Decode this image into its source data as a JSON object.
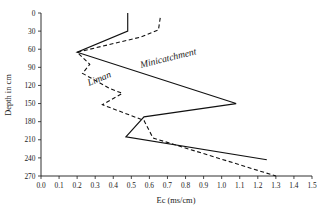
{
  "chart_data": {
    "type": "line",
    "title": "",
    "xlabel": "Ec (ms/cm)",
    "ylabel": "Depth in cm",
    "xlim": [
      0.0,
      1.5
    ],
    "ylim": [
      0,
      270
    ],
    "y_inverted": true,
    "grid": false,
    "legend_position": "inline-annotations",
    "xticks": [
      "0.0",
      "0.1",
      "0.2",
      "0.3",
      "0.4",
      "0.5",
      "0.6",
      "0.7",
      "0.8",
      "0.9",
      "1.0",
      "1.1",
      "1.2",
      "1.3",
      "1.4",
      "1.5"
    ],
    "xtick_values": [
      0.0,
      0.1,
      0.2,
      0.3,
      0.4,
      0.5,
      0.6,
      0.7,
      0.8,
      0.9,
      1.0,
      1.1,
      1.2,
      1.3,
      1.4,
      1.5
    ],
    "yticks": [
      "0",
      "30",
      "60",
      "90",
      "120",
      "150",
      "180",
      "210",
      "240",
      "270"
    ],
    "ytick_values": [
      0,
      30,
      60,
      90,
      120,
      150,
      180,
      210,
      240,
      270
    ],
    "series": [
      {
        "name": "Minicatchment",
        "style": "solid",
        "label_rotation_deg": -14,
        "ec": [
          0.48,
          0.48,
          0.2,
          1.08,
          0.57,
          0.47,
          1.25
        ],
        "depth": [
          0,
          30,
          65,
          150,
          172,
          205,
          243
        ]
      },
      {
        "name": "Liman",
        "style": "dashed",
        "label_rotation_deg": -22,
        "ec": [
          0.66,
          0.65,
          0.55,
          0.2,
          0.27,
          0.23,
          0.38,
          0.45,
          0.34,
          0.57,
          0.62,
          1.3
        ],
        "depth": [
          8,
          28,
          40,
          65,
          85,
          100,
          125,
          133,
          152,
          178,
          207,
          270
        ]
      }
    ]
  }
}
